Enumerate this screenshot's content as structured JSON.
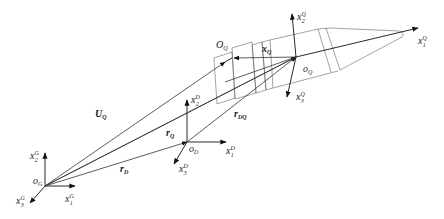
{
  "diagram": {
    "frames": [
      {
        "id": "G",
        "origin_label": "o",
        "origin_sub": "G",
        "axes": [
          {
            "label": "x",
            "sup": "G",
            "sub": "1"
          },
          {
            "label": "x",
            "sup": "G",
            "sub": "2"
          },
          {
            "label": "x",
            "sup": "G",
            "sub": "3"
          }
        ]
      },
      {
        "id": "D",
        "origin_label": "o",
        "origin_sub": "D",
        "axes": [
          {
            "label": "x",
            "sup": "D",
            "sub": "1"
          },
          {
            "label": "x",
            "sup": "D",
            "sub": "2"
          },
          {
            "label": "x",
            "sup": "D",
            "sub": "3"
          }
        ]
      },
      {
        "id": "Q",
        "origin_label": "o",
        "origin_sub": "Q",
        "axes": [
          {
            "label": "x",
            "sup": "Q",
            "sub": "1"
          },
          {
            "label": "x",
            "sup": "Q",
            "sub": "2"
          },
          {
            "label": "x",
            "sup": "Q",
            "sub": "3"
          }
        ]
      }
    ],
    "point_OQ": {
      "label": "O",
      "sub": "Q"
    },
    "vectors": [
      {
        "label": "U",
        "sub": "Q",
        "bold": true
      },
      {
        "label": "r",
        "sub": "Q",
        "bold": true
      },
      {
        "label": "r",
        "sub": "D",
        "bold": true
      },
      {
        "label": "r",
        "sub": "DQ",
        "bold": true
      },
      {
        "label": "x",
        "sub": "Q",
        "bold": true
      }
    ]
  }
}
